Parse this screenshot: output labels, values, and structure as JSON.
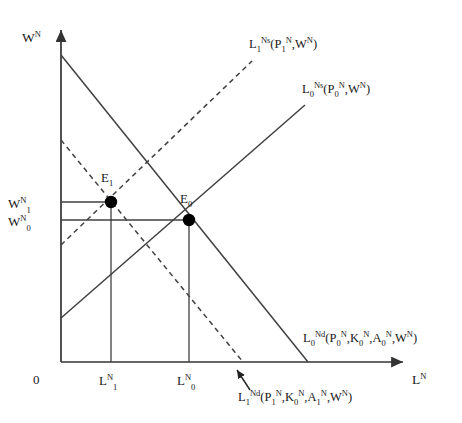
{
  "figure": {
    "type": "economics-supply-demand-diagram",
    "background_color": "#ffffff",
    "line_color": "#404040",
    "point_color": "#000000"
  },
  "axes": {
    "y_axis": {
      "label_base": "W",
      "label_sup": "N",
      "name": "nominal-wage-axis",
      "x": 61,
      "y_top": 26,
      "y_bottom": 362,
      "label_x": 22,
      "label_y": 42
    },
    "x_axis": {
      "label_base": "L",
      "label_sup": "N",
      "name": "nontradable-labour-axis",
      "y": 362,
      "x_left": 61,
      "x_right": 407,
      "label_x": 412,
      "label_y": 382
    },
    "origin": {
      "label": "0",
      "x": 36,
      "y": 384
    }
  },
  "curves": [
    {
      "id": "demand-0",
      "style": "solid",
      "label_parts": {
        "base": "L",
        "sub": "0",
        "sup": "Nd",
        "args": "(P",
        "arg_subs": [
          "0",
          "0",
          "0"
        ],
        "full": "L0Nd(P0N,K0N,A0N,WN)"
      },
      "x1": 61,
      "y1": 55,
      "x2": 308,
      "y2": 362,
      "label_x": 305,
      "label_y": 340
    },
    {
      "id": "demand-1",
      "style": "dashed",
      "label_parts": {
        "base": "L",
        "sub": "1",
        "sup": "Nd",
        "full": "L1Nd(P1N,K0N,A1N,WN)"
      },
      "x1": 61,
      "y1": 140,
      "x2": 243,
      "y2": 362,
      "label_x": 238,
      "label_y": 400
    },
    {
      "id": "supply-0",
      "style": "solid",
      "label_parts": {
        "base": "L",
        "sub": "0",
        "sup": "Ns",
        "full": "L0Ns(P0N,WN)"
      },
      "x1": 61,
      "y1": 318,
      "x2": 305,
      "y2": 105,
      "label_x": 302,
      "label_y": 92
    },
    {
      "id": "supply-1",
      "style": "dashed",
      "label_parts": {
        "base": "L",
        "sub": "1",
        "sup": "Ns",
        "full": "L1Ns(P1N,WN)"
      },
      "x1": 61,
      "y1": 245,
      "x2": 252,
      "y2": 61,
      "label_x": 249,
      "label_y": 48
    }
  ],
  "equilibria": [
    {
      "id": "E0",
      "label_base": "E",
      "label_sub": "0",
      "x": 189,
      "y": 220,
      "radius": 6,
      "label_x": 180,
      "label_y": 203,
      "wage_label_base": "W",
      "wage_label_sup": "N",
      "wage_label_sub": "0",
      "wage_label_x": 8,
      "wage_label_y": 226,
      "quantity_label_base": "L",
      "quantity_label_sup": "N",
      "quantity_label_sub": "0",
      "quantity_label_x": 176,
      "quantity_label_y": 385
    },
    {
      "id": "E1",
      "label_base": "E",
      "label_sub": "1",
      "x": 111,
      "y": 202,
      "radius": 6,
      "label_x": 102,
      "label_y": 181,
      "wage_label_base": "W",
      "wage_label_sup": "N",
      "wage_label_sub": "1",
      "wage_label_x": 8,
      "wage_label_y": 208,
      "quantity_label_base": "L",
      "quantity_label_sup": "N",
      "quantity_label_sub": "1",
      "quantity_label_x": 98,
      "quantity_label_y": 385
    }
  ],
  "annotation_arrow": {
    "name": "demand-shift-arrow",
    "from_x": 250,
    "from_y": 390,
    "to_x": 236,
    "to_y": 369
  },
  "text_symbols": {
    "W": "W",
    "L": "L",
    "E": "E",
    "P": "P",
    "K": "K",
    "A": "A",
    "N": "N",
    "Nd": "Nd",
    "Ns": "Ns",
    "zero": "0",
    "one": "1",
    "open_paren": "(",
    "close_paren": ")",
    "comma": ","
  }
}
